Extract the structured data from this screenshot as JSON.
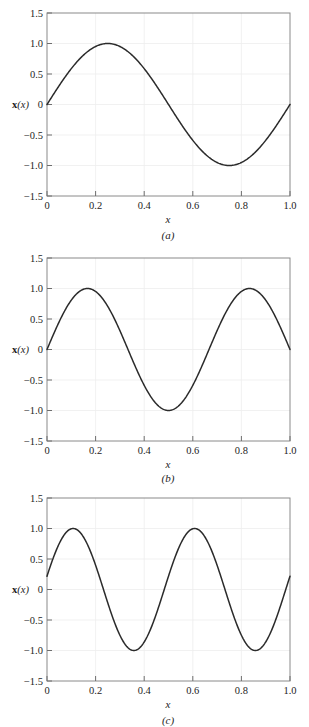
{
  "figure": {
    "background_color": "#ffffff",
    "curve_color": "#2b2b2b",
    "frame_color": "#8a8a8a",
    "grid_color": "#ededed"
  },
  "panels": [
    {
      "caption": "(a)",
      "ylabel_bold": "x",
      "ylabel_italic": "(x)",
      "xlabel": "x",
      "xticks": [
        "0",
        "0.2",
        "0.4",
        "0.6",
        "0.8",
        "1.0"
      ],
      "yticks": [
        "1.5",
        "1.0",
        "0.5",
        "0",
        "−0.5",
        "−1.0",
        "−1.5"
      ]
    },
    {
      "caption": "(b)",
      "ylabel_bold": "x",
      "ylabel_italic": "(x)",
      "xlabel": "x",
      "xticks": [
        "0",
        "0.2",
        "0.4",
        "0.6",
        "0.8",
        "1.0"
      ],
      "yticks": [
        "1.5",
        "1.0",
        "0.5",
        "0",
        "−0.5",
        "−1.0",
        "−1.5"
      ]
    },
    {
      "caption": "(c)",
      "ylabel_bold": "x",
      "ylabel_italic": "(x)",
      "xlabel": "x",
      "xticks": [
        "0",
        "0.2",
        "0.4",
        "0.6",
        "0.8",
        "1.0"
      ],
      "yticks": [
        "1.5",
        "1.0",
        "0.5",
        "0",
        "−0.5",
        "−1.0",
        "−1.5"
      ]
    }
  ],
  "chart_data": [
    {
      "type": "line",
      "title": "(a)",
      "xlabel": "x",
      "ylabel": "x(x)",
      "xlim": [
        0,
        1.0
      ],
      "ylim": [
        -1.5,
        1.5
      ],
      "xticks": [
        0,
        0.2,
        0.4,
        0.6,
        0.8,
        1.0
      ],
      "yticks": [
        1.5,
        1.0,
        0.5,
        0,
        -0.5,
        -1.0,
        -1.5
      ],
      "grid": true,
      "legend": "none",
      "description": "One full sine period: sin(2*pi*x). Zero at x=0, peak 1.0 at x=0.25, zero at x=0.5, trough -1.0 at x=0.75, zero at x=1.0",
      "series": [
        {
          "name": "mode 1",
          "formula": "sin(2*pi*x)",
          "x": [
            0,
            0.05,
            0.1,
            0.15,
            0.2,
            0.25,
            0.3,
            0.35,
            0.4,
            0.45,
            0.5,
            0.55,
            0.6,
            0.65,
            0.7,
            0.75,
            0.8,
            0.85,
            0.9,
            0.95,
            1.0
          ],
          "values": [
            0.0,
            0.309,
            0.588,
            0.809,
            0.951,
            1.0,
            0.951,
            0.809,
            0.588,
            0.309,
            0.0,
            -0.309,
            -0.588,
            -0.809,
            -0.951,
            -1.0,
            -0.951,
            -0.809,
            -0.588,
            -0.309,
            0.0
          ]
        }
      ]
    },
    {
      "type": "line",
      "title": "(b)",
      "xlabel": "x",
      "ylabel": "x(x)",
      "xlim": [
        0,
        1.0
      ],
      "ylim": [
        -1.5,
        1.5
      ],
      "xticks": [
        0,
        0.2,
        0.4,
        0.6,
        0.8,
        1.0
      ],
      "yticks": [
        1.5,
        1.0,
        0.5,
        0,
        -0.5,
        -1.0,
        -1.5
      ],
      "grid": true,
      "legend": "none",
      "description": "One and a half sine periods: sin(3*pi*x). Zero at x=0, peak 1.0 at x=0.167, zero at x=0.333, trough -1.0 at x=0.5, zero at x=0.667, peak 1.0 at x=0.833, zero at x=1.0",
      "series": [
        {
          "name": "mode 2",
          "formula": "sin(3*pi*x)",
          "x": [
            0,
            0.05,
            0.1,
            0.15,
            0.2,
            0.25,
            0.3,
            0.35,
            0.4,
            0.45,
            0.5,
            0.55,
            0.6,
            0.65,
            0.7,
            0.75,
            0.8,
            0.85,
            0.9,
            0.95,
            1.0
          ],
          "values": [
            0.0,
            0.454,
            0.809,
            0.988,
            0.951,
            0.707,
            0.309,
            -0.156,
            -0.588,
            -0.891,
            -1.0,
            -0.891,
            -0.588,
            -0.156,
            0.309,
            0.707,
            0.951,
            0.988,
            0.809,
            0.454,
            0.0
          ]
        }
      ]
    },
    {
      "type": "line",
      "title": "(c)",
      "xlabel": "x",
      "ylabel": "x(x)",
      "xlim": [
        0,
        1.0
      ],
      "ylim": [
        -1.5,
        1.5
      ],
      "xticks": [
        0,
        0.2,
        0.4,
        0.6,
        0.8,
        1.0
      ],
      "yticks": [
        1.5,
        1.0,
        0.5,
        0,
        -0.5,
        -1.0,
        -1.5
      ],
      "grid": true,
      "legend": "none",
      "description": "Two sine periods with phase offset: sin(4*pi*x + 0.22). Starts at 0.22 at x=0, peak 1.0 at x=0.11, trough -1.0 at x=0.365, peak 1.0 at x=0.62, trough -1.0 at x=0.875, ends near -0.05 at x=1.0",
      "series": [
        {
          "name": "mode 3",
          "formula": "sin(4*pi*x + 0.22)",
          "x": [
            0,
            0.05,
            0.1,
            0.15,
            0.2,
            0.25,
            0.3,
            0.35,
            0.4,
            0.45,
            0.5,
            0.55,
            0.6,
            0.65,
            0.7,
            0.75,
            0.8,
            0.85,
            0.9,
            0.95,
            1.0
          ],
          "values": [
            0.218,
            0.78,
            0.998,
            0.781,
            0.219,
            -0.434,
            -0.879,
            -0.985,
            -0.705,
            -0.136,
            0.429,
            0.877,
            0.986,
            0.709,
            0.142,
            -0.425,
            -0.874,
            -0.987,
            -0.713,
            -0.147,
            0.218
          ]
        }
      ]
    }
  ]
}
